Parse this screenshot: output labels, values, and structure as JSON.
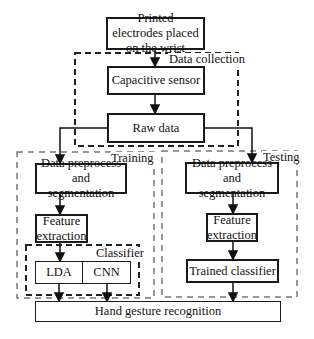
{
  "diagram": {
    "nodes": {
      "electrodes": "Printed electrodes placed on the wrist",
      "capacitive_sensor": "Capacitive sensor",
      "raw_data": "Raw data",
      "train_preprocess": "Data preprocess and segmentation",
      "train_feature": "Feature extraction",
      "lda": "LDA",
      "cnn": "CNN",
      "test_preprocess": "Data preprocess and segmentation",
      "test_feature": "Feature extraction",
      "trained_classifier": "Trained classifier",
      "hand_gesture": "Hand gesture recognition"
    },
    "groups": {
      "data_collection": "Data collection",
      "training": "Training",
      "testing": "Testing",
      "classifier": "Classifier"
    },
    "edges": [
      [
        "electrodes",
        "capacitive_sensor"
      ],
      [
        "capacitive_sensor",
        "raw_data"
      ],
      [
        "raw_data",
        "train_preprocess"
      ],
      [
        "raw_data",
        "test_preprocess"
      ],
      [
        "train_preprocess",
        "train_feature"
      ],
      [
        "train_feature",
        "classifier"
      ],
      [
        "lda",
        "hand_gesture"
      ],
      [
        "cnn",
        "hand_gesture"
      ],
      [
        "test_preprocess",
        "test_feature"
      ],
      [
        "test_feature",
        "trained_classifier"
      ],
      [
        "trained_classifier",
        "hand_gesture"
      ]
    ]
  }
}
